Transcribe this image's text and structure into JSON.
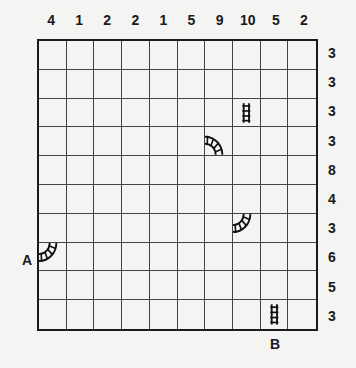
{
  "puzzle": {
    "type": "train-tracks",
    "size": 10,
    "column_clues": [
      "4",
      "1",
      "2",
      "2",
      "1",
      "5",
      "9",
      "10",
      "5",
      "2"
    ],
    "row_clues": [
      "3",
      "3",
      "3",
      "3",
      "8",
      "4",
      "3",
      "6",
      "5",
      "3"
    ],
    "start_label": "A",
    "end_label": "B",
    "given_pieces": [
      {
        "row": 2,
        "col": 7,
        "kind": "straight-vertical",
        "icon": "track-straight-vertical-icon"
      },
      {
        "row": 3,
        "col": 6,
        "kind": "curve-west-south",
        "icon": "track-curve-icon"
      },
      {
        "row": 6,
        "col": 7,
        "kind": "curve-west-north",
        "icon": "track-curve-icon"
      },
      {
        "row": 7,
        "col": 0,
        "kind": "curve-west-north",
        "icon": "track-curve-icon"
      },
      {
        "row": 9,
        "col": 8,
        "kind": "straight-vertical",
        "icon": "track-straight-vertical-icon"
      }
    ]
  }
}
